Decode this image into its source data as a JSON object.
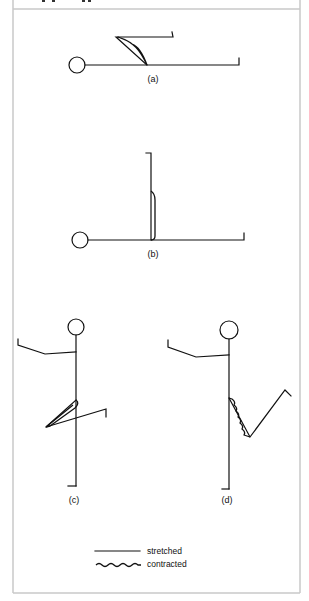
{
  "figure": {
    "header_text_visible": false,
    "panels": [
      {
        "id": "a",
        "caption": "(a)",
        "pose": "lying, knee flexed upward",
        "muscle_state": "stretched"
      },
      {
        "id": "b",
        "caption": "(b)",
        "pose": "lying, leg raised vertical",
        "muscle_state": "stretched"
      },
      {
        "id": "c",
        "caption": "(c)",
        "pose": "standing, knee raised and bent across",
        "muscle_state": "stretched"
      },
      {
        "id": "d",
        "caption": "(d)",
        "pose": "standing, thigh raised with knee bent",
        "muscle_state": "contracted"
      }
    ],
    "legend": [
      {
        "style": "straight-line",
        "label": "stretched"
      },
      {
        "style": "wavy-line",
        "label": "contracted"
      }
    ]
  },
  "colors": {
    "line": "#111111",
    "frame": "#c8c8c8",
    "background": "#ffffff"
  }
}
